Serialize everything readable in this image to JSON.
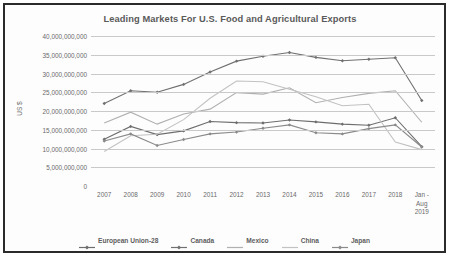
{
  "chart_data": {
    "type": "line",
    "title": "Leading Markets For U.S. Food and Agricultural Exports",
    "xlabel": "",
    "ylabel": "US $",
    "categories": [
      "2007",
      "2008",
      "2009",
      "2010",
      "2011",
      "2012",
      "2013",
      "2014",
      "2015",
      "2016",
      "2017",
      "2018",
      "Jan -\nAug\n2019"
    ],
    "ylim": [
      0,
      40000000000
    ],
    "ytick_values": [
      0,
      5000000000,
      10000000000,
      15000000000,
      20000000000,
      25000000000,
      30000000000,
      35000000000,
      40000000000
    ],
    "ytick_labels": [
      "0",
      "5,000,000,000",
      "10,000,000,000",
      "15,000,000,000",
      "20,000,000,000",
      "25,000,000,000",
      "30,000,000,000",
      "35,000,000,000",
      "40,000,000,000"
    ],
    "grid": true,
    "legend_position": "bottom",
    "series": [
      {
        "name": "European Union-28",
        "color": "#6d6d6d",
        "marker": "diamond",
        "values": [
          12500000000,
          15900000000,
          13700000000,
          14700000000,
          17200000000,
          16900000000,
          16800000000,
          17600000000,
          17100000000,
          16500000000,
          16200000000,
          18200000000,
          10500000000
        ]
      },
      {
        "name": "Canada",
        "color": "#707070",
        "marker": "diamond",
        "values": [
          22000000000,
          25400000000,
          25000000000,
          27100000000,
          30400000000,
          33300000000,
          34600000000,
          35600000000,
          34300000000,
          33400000000,
          33800000000,
          34200000000,
          22800000000
        ]
      },
      {
        "name": "Mexico",
        "color": "#b0b0b0",
        "marker": "none",
        "values": [
          16800000000,
          19700000000,
          16500000000,
          19200000000,
          20500000000,
          24900000000,
          24500000000,
          26200000000,
          22200000000,
          23600000000,
          24700000000,
          25400000000,
          17000000000
        ]
      },
      {
        "name": "China",
        "color": "#c2c2c2",
        "marker": "none",
        "values": [
          9200000000,
          13400000000,
          13800000000,
          17700000000,
          23400000000,
          28000000000,
          27800000000,
          25800000000,
          23800000000,
          21400000000,
          21800000000,
          11700000000,
          9700000000
        ]
      },
      {
        "name": "Japan",
        "color": "#8a8a8a",
        "marker": "diamond",
        "values": [
          12000000000,
          13900000000,
          10800000000,
          12400000000,
          13900000000,
          14400000000,
          15400000000,
          16300000000,
          14200000000,
          13900000000,
          15300000000,
          16300000000,
          10400000000
        ]
      }
    ]
  },
  "legend": {
    "items": [
      {
        "label": "European Union-28"
      },
      {
        "label": "Canada"
      },
      {
        "label": "Mexico"
      },
      {
        "label": "China"
      },
      {
        "label": "Japan"
      }
    ]
  }
}
